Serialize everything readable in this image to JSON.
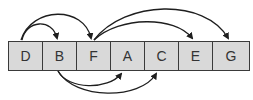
{
  "diagram": {
    "type": "array-with-pointer-arcs",
    "cells": [
      {
        "label": "D"
      },
      {
        "label": "B"
      },
      {
        "label": "F"
      },
      {
        "label": "A"
      },
      {
        "label": "C"
      },
      {
        "label": "E"
      },
      {
        "label": "G"
      }
    ],
    "arcs_above": [
      {
        "from": "D",
        "to": "B"
      },
      {
        "from": "D",
        "to": "F"
      },
      {
        "from": "F",
        "to": "E"
      },
      {
        "from": "F",
        "to": "G"
      }
    ],
    "arcs_below": [
      {
        "from": "B",
        "to": "A"
      },
      {
        "from": "B",
        "to": "C"
      }
    ],
    "colors": {
      "cell_fill": "#d9d9d9",
      "border": "#3a3a3a",
      "arc": "#1e1e1e",
      "text": "#333333"
    }
  }
}
